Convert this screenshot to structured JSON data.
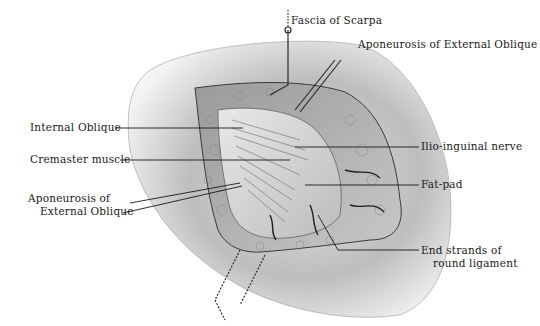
{
  "figure": {
    "colors": {
      "background": "#ffffff",
      "skin": "#cfcfcf",
      "skin_shadow": "#8a8a8a",
      "fat": "#b5b5b5",
      "muscle": "#d8d8d8",
      "line": "#1a1a1a"
    },
    "labels": [
      {
        "id": "fascia-of-scarpa",
        "text": "Fascia of Scarpa"
      },
      {
        "id": "aponeurosis-top",
        "text": "Aponeurosis of External Oblique"
      },
      {
        "id": "internal-oblique",
        "text": "Internal Oblique"
      },
      {
        "id": "cremaster-muscle",
        "text": "Cremaster muscle"
      },
      {
        "id": "aponeurosis-left",
        "line1": "Aponeurosis of",
        "line2": "External Oblique"
      },
      {
        "id": "ilio-inguinal-nerve",
        "text": "Ilio-inguinal nerve"
      },
      {
        "id": "fat-pad",
        "text": "Fat-pad"
      },
      {
        "id": "round-ligament",
        "line1": "End strands of",
        "line2": "round ligament"
      }
    ]
  }
}
